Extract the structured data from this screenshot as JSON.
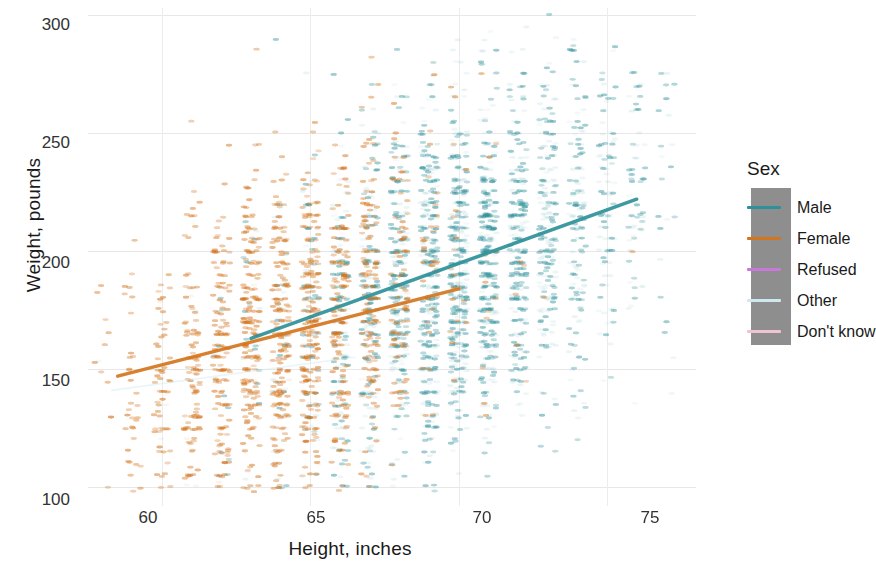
{
  "chart_data": {
    "type": "scatter",
    "title": "",
    "xlabel": "Height, inches",
    "ylabel": "Weight, pounds",
    "xlim": [
      57.5,
      78.0
    ],
    "ylim": [
      92,
      303
    ],
    "xticks": [
      60,
      65,
      70,
      75
    ],
    "yticks": [
      100,
      150,
      200,
      250,
      300
    ],
    "xtick_labels": [
      "60",
      "65",
      "70",
      "75"
    ],
    "ytick_labels": [
      "100",
      "150",
      "200",
      "250",
      "300"
    ],
    "grid": true,
    "legend_position": "right",
    "legend_title": "Sex",
    "series": [
      {
        "name": "Male",
        "color": "#2e9099",
        "point_count": 9000,
        "x_center": 70.0,
        "x_spread": 3.0,
        "y_center": 192,
        "y_spread": 40,
        "trend": {
          "x0": 63.0,
          "y0": 163,
          "x1": 76.0,
          "y1": 222
        }
      },
      {
        "name": "Female",
        "color": "#d4751e",
        "point_count": 9000,
        "x_center": 64.2,
        "x_spread": 2.7,
        "y_center": 163,
        "y_spread": 38,
        "trend": {
          "x0": 58.5,
          "y0": 147,
          "x1": 70.0,
          "y1": 184
        }
      },
      {
        "name": "Refused",
        "color": "#c878d8",
        "point_count": 12,
        "x_center": 67.0,
        "x_spread": 3.0,
        "y_center": 178,
        "y_spread": 35,
        "trend": null
      },
      {
        "name": "Other",
        "color": "#cfe8ef",
        "point_count": 20,
        "x_center": 66.0,
        "x_spread": 3.2,
        "y_center": 172,
        "y_spread": 36,
        "trend": {
          "x0": 58.3,
          "y0": 141,
          "x1": 66.5,
          "y1": 155
        }
      },
      {
        "name": "Don't know",
        "color": "#f0c3d4",
        "point_count": 8,
        "x_center": 66.5,
        "x_spread": 3.0,
        "y_center": 175,
        "y_spread": 30,
        "trend": null
      }
    ]
  },
  "legend": {
    "title": "Sex",
    "box_color": "#8e8e8e",
    "entries": [
      {
        "label": "Male",
        "color": "#2e9099"
      },
      {
        "label": "Female",
        "color": "#d4751e"
      },
      {
        "label": "Refused",
        "color": "#c878d8"
      },
      {
        "label": "Other",
        "color": "#cfe8ef"
      },
      {
        "label": "Don't know",
        "color": "#f0c3d4"
      }
    ]
  },
  "axes": {
    "y_title": "Weight, pounds",
    "x_title": "Height, inches",
    "y_tick_0": "300",
    "y_tick_1": "250",
    "y_tick_2": "200",
    "y_tick_3": "150",
    "y_tick_4": "100",
    "x_tick_0": "60",
    "x_tick_1": "65",
    "x_tick_2": "70",
    "x_tick_3": "75"
  }
}
